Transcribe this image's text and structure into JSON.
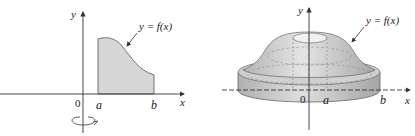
{
  "left_panel": {
    "y_axis_label": "y",
    "x_axis_label": "x",
    "origin_label": "0",
    "a_label": "a",
    "b_label": "b",
    "curve_label": "y = f(x)",
    "rotation_indicator": "rotation about y-axis"
  },
  "right_panel": {
    "y_axis_label": "y",
    "x_axis_label": "x",
    "origin_label": "0",
    "a_label": "a",
    "b_label": "b",
    "curve_label": "y = f(x)"
  },
  "colors": {
    "region_fill": "#d6d6d6",
    "solid_light": "#e2e2e2",
    "solid_mid": "#c8c8c8",
    "solid_dark": "#a9a9a9",
    "axis": "#333333"
  }
}
